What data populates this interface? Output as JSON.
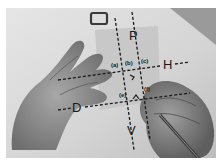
{
  "figure": {
    "axes_labels": {
      "P": "P",
      "H": "H",
      "D": "D",
      "V": "V"
    },
    "small_labels": {
      "a": "(a)",
      "b": "(b)",
      "c": "(c)",
      "d": "(d)",
      "e": "(e)",
      "f": "(f)"
    },
    "colors": {
      "background": "#d9d9d9",
      "line": "#1a1a1a",
      "paper": "#c8c8c8",
      "skin": "#8c8c8c"
    }
  }
}
